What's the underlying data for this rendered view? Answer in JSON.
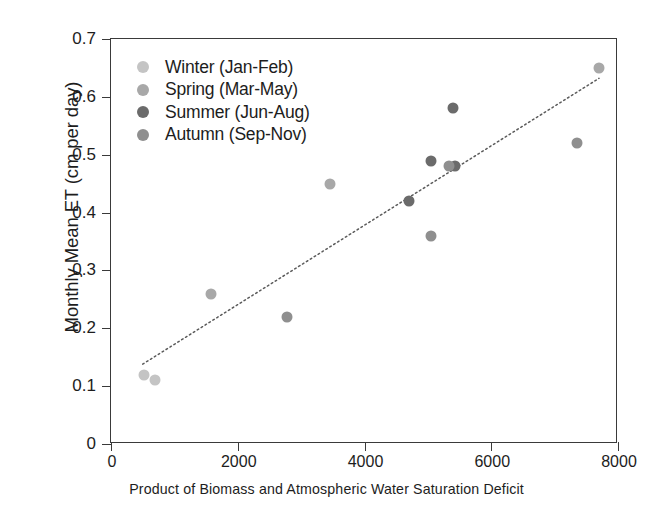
{
  "chart_data": {
    "type": "scatter",
    "title": "",
    "xlabel": "Product of Biomass and Atmospheric Water Saturation Deficit",
    "ylabel": "Monthly Mean ET (cm per day)",
    "xlim": [
      0,
      8000
    ],
    "ylim": [
      0,
      0.7
    ],
    "xticks": [
      0,
      2000,
      4000,
      6000,
      8000
    ],
    "xtick_labels": [
      "0",
      "2000",
      "4000",
      "6000",
      "8000"
    ],
    "yticks": [
      0,
      0.1,
      0.2,
      0.3,
      0.4,
      0.5,
      0.6,
      0.7
    ],
    "ytick_labels": [
      "0",
      "0.1",
      "0.2",
      "0.3",
      "0.4",
      "0.5",
      "0.6",
      "0.7"
    ],
    "grid": false,
    "legend_position": "top-left",
    "series": [
      {
        "name": "Winter (Jan-Feb)",
        "color": "#c4c4c4",
        "points": [
          {
            "x": 520,
            "y": 0.12
          },
          {
            "x": 700,
            "y": 0.11
          }
        ]
      },
      {
        "name": "Spring (Mar-May)",
        "color": "#a8a8a8",
        "points": [
          {
            "x": 1580,
            "y": 0.26
          },
          {
            "x": 3450,
            "y": 0.45
          },
          {
            "x": 7700,
            "y": 0.65
          }
        ]
      },
      {
        "name": "Summer (Jun-Aug)",
        "color": "#6b6b6b",
        "points": [
          {
            "x": 4700,
            "y": 0.42
          },
          {
            "x": 5050,
            "y": 0.49
          },
          {
            "x": 5400,
            "y": 0.58
          },
          {
            "x": 5430,
            "y": 0.48
          }
        ]
      },
      {
        "name": "Autumn (Sep-Nov)",
        "color": "#8f8f8f",
        "points": [
          {
            "x": 2780,
            "y": 0.22
          },
          {
            "x": 5050,
            "y": 0.36
          },
          {
            "x": 5330,
            "y": 0.48
          },
          {
            "x": 7350,
            "y": 0.52
          }
        ]
      }
    ],
    "trendline": {
      "style": "dotted",
      "color": "#5a5a5a",
      "x_start": 500,
      "y_start": 0.138,
      "x_end": 7700,
      "y_end": 0.632
    }
  },
  "legend": {
    "entries": [
      {
        "label": "Winter (Jan-Feb)",
        "color": "#c4c4c4"
      },
      {
        "label": "Spring (Mar-May)",
        "color": "#a8a8a8"
      },
      {
        "label": "Summer (Jun-Aug)",
        "color": "#6b6b6b"
      },
      {
        "label": "Autumn (Sep-Nov)",
        "color": "#8f8f8f"
      }
    ]
  }
}
